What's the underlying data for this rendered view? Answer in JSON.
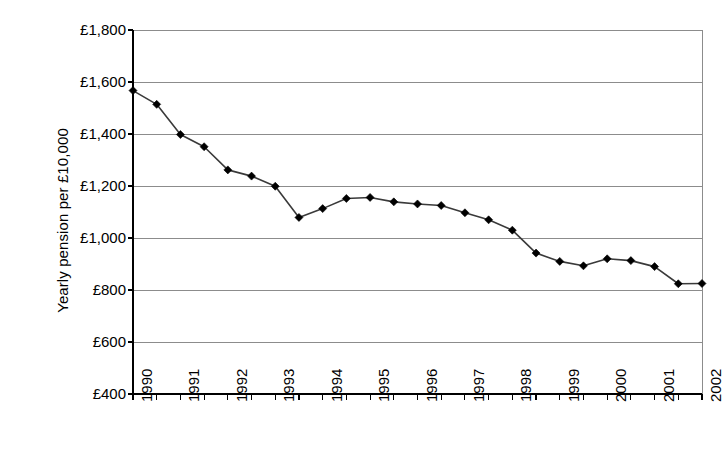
{
  "chart_data": {
    "type": "line",
    "title": "",
    "subtitle": "",
    "xlabel": "",
    "ylabel": "Yearly pension per £10,000",
    "ylim": [
      400,
      1800
    ],
    "ytick_step": 200,
    "ytick_labels": [
      "£1,800",
      "£1,600",
      "£1,400",
      "£1,200",
      "£1,000",
      "£800",
      "£600",
      "£400"
    ],
    "ytick_values": [
      1800,
      1600,
      1400,
      1200,
      1000,
      800,
      600,
      400
    ],
    "xtick_labels": [
      "1990",
      "1991",
      "1992",
      "1993",
      "1994",
      "1995",
      "1996",
      "1997",
      "1998",
      "1999",
      "2000",
      "2001",
      "2002"
    ],
    "xlim": [
      1990,
      2002
    ],
    "x_minor_ticks": "semi-annual",
    "grid": "horizontal",
    "legend": "none",
    "marker": "diamond",
    "marker_color": "#000000",
    "line_color": "#3a3a3a",
    "currency": "GBP",
    "x": [
      1990.0,
      1990.5,
      1991.0,
      1991.5,
      1992.0,
      1992.5,
      1993.0,
      1993.5,
      1994.0,
      1994.5,
      1995.0,
      1995.5,
      1996.0,
      1996.5,
      1997.0,
      1997.5,
      1998.0,
      1998.5,
      1999.0,
      1999.5,
      2000.0,
      2000.5,
      2001.0,
      2001.5,
      2002.0
    ],
    "values": [
      1567,
      1514,
      1398,
      1351,
      1262,
      1238,
      1199,
      1079,
      1113,
      1152,
      1156,
      1139,
      1131,
      1125,
      1097,
      1070,
      1030,
      942,
      910,
      893,
      920,
      913,
      890,
      824,
      825
    ],
    "point_labels": [
      "1990.0: £1,567",
      "1990.5: £1,514",
      "1991.0: £1,398",
      "1991.5: £1,351",
      "1992.0: £1,262",
      "1992.5: £1,238",
      "1993.0: £1,199",
      "1993.5: £1,079",
      "1994.0: £1,113",
      "1994.5: £1,152",
      "1995.0: £1,156",
      "1995.5: £1,139",
      "1996.0: £1,131",
      "1996.5: £1,125",
      "1997.0: £1,097",
      "1997.5: £1,070",
      "1998.0: £1,030",
      "1998.5: £942",
      "1999.0: £910",
      "1999.5: £893",
      "2000.0: £920",
      "2000.5: £913",
      "2001.0: £890",
      "2001.5: £824",
      "2002.0: £825"
    ]
  },
  "colors": {
    "background": "#ffffff",
    "axis": "#000000",
    "gridline": "#8c8c8c",
    "series": "#3a3a3a",
    "marker": "#000000",
    "text": "#000000"
  }
}
